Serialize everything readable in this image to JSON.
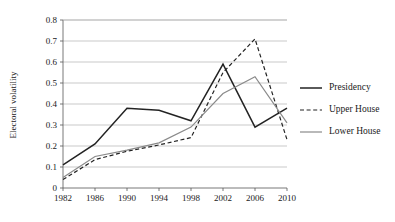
{
  "chart_data": {
    "type": "line",
    "title": "",
    "xlabel": "",
    "ylabel": "Electoral volatility",
    "categories": [
      "1982",
      "1986",
      "1990",
      "1994",
      "1998",
      "2002",
      "2006",
      "2010"
    ],
    "ylim": [
      0,
      0.8
    ],
    "y_ticks": [
      "0",
      "0.1",
      "0.2",
      "0.3",
      "0.4",
      "0.5",
      "0.6",
      "0.7",
      "0.8"
    ],
    "y_tick_values": [
      0,
      0.1,
      0.2,
      0.3,
      0.4,
      0.5,
      0.6,
      0.7,
      0.8
    ],
    "grid": true,
    "legend_position": "right",
    "series": [
      {
        "name": "Presidency",
        "style": "solid",
        "color": "#232323",
        "values": [
          0.11,
          0.21,
          0.38,
          0.37,
          0.32,
          0.59,
          0.29,
          0.38
        ]
      },
      {
        "name": "Upper House",
        "style": "dashed",
        "color": "#232323",
        "values": [
          0.04,
          0.135,
          0.175,
          0.205,
          0.24,
          0.55,
          0.71,
          0.23
        ]
      },
      {
        "name": "Lower House",
        "style": "solid",
        "color": "#8a8a8a",
        "values": [
          0.05,
          0.15,
          0.18,
          0.215,
          0.29,
          0.45,
          0.53,
          0.31
        ]
      }
    ]
  },
  "legend": {
    "items": [
      {
        "label": "Presidency"
      },
      {
        "label": "Upper House"
      },
      {
        "label": "Lower House"
      }
    ]
  },
  "axes": {
    "y_title": "Electoral volatility"
  }
}
